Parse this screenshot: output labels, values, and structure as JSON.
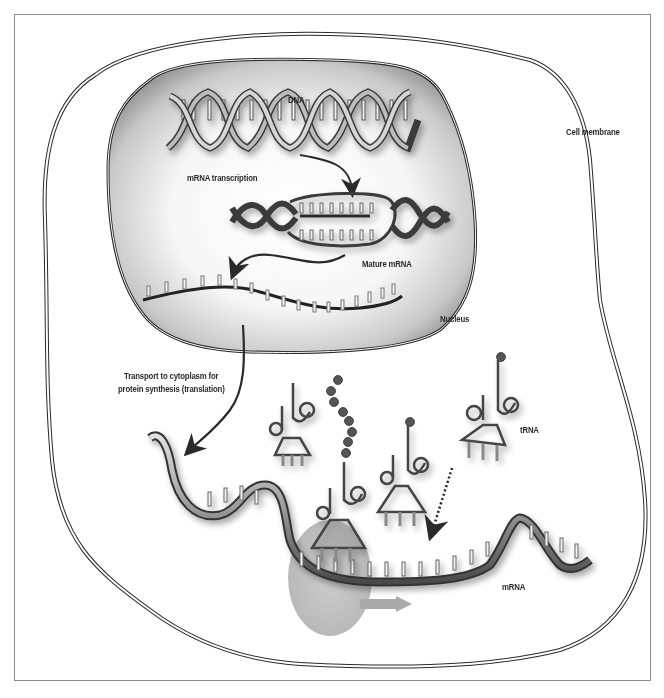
{
  "figure": {
    "type": "biology-diagram"
  },
  "labels": {
    "dna": "DNA",
    "mrna_transcription": "mRNA transcription",
    "mature_mrna": "Mature mRNA",
    "nucleus": "Nucleus",
    "cell_membrane": "Cell membrane",
    "transport_line1": "Transport to cytoplasm for",
    "transport_line2": "protein synthesis (translation)",
    "trna": "tRNA",
    "mrna": "mRNA"
  },
  "colors": {
    "outline": "#2a2a2a",
    "nucleus_fill_edge": "#9a9a9a",
    "nucleus_fill_center": "#ffffff",
    "ribosome": "#bdbdbd",
    "amino_acid": "#555555",
    "frame": "#8a8a8a"
  }
}
